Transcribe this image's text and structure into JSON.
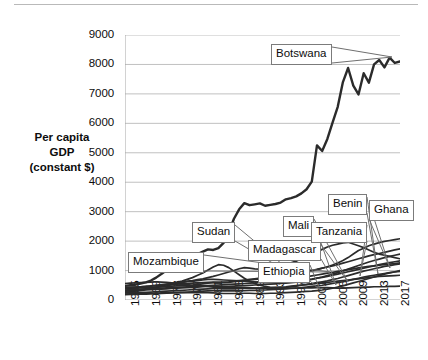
{
  "chart_data": {
    "type": "line",
    "title": "",
    "xlabel": "",
    "ylabel": "Per capita GDP (constant $)",
    "ylabel_lines": [
      "Per capita",
      "GDP",
      "(constant $)"
    ],
    "ylim": [
      0,
      9000
    ],
    "ytick_values": [
      0,
      1000,
      2000,
      3000,
      4000,
      5000,
      6000,
      7000,
      8000,
      9000
    ],
    "ytick_labels": [
      "0",
      "1000",
      "2000",
      "3000",
      "4000",
      "5000",
      "6000",
      "7000",
      "8000",
      "9000"
    ],
    "xlim": [
      1965,
      2018
    ],
    "xtick_labels": [
      "1965",
      "1969",
      "1973",
      "1977",
      "1981",
      "1985",
      "1989",
      "1993",
      "1997",
      "2001",
      "2005",
      "2009",
      "2013",
      "2017"
    ],
    "xtick_values": [
      1965,
      1969,
      1973,
      1977,
      1981,
      1985,
      1989,
      1993,
      1997,
      2001,
      2005,
      2009,
      2013,
      2017
    ],
    "grid": "horizontal",
    "legend": "callout-labels",
    "line_color": "#2b2b2b",
    "grid_color": "#c0c0c0",
    "axis_color": "#a6a6a6",
    "annotations": [
      {
        "label": "Botswana",
        "box_x": 271,
        "box_y": 44,
        "tip_x": 392,
        "tip_y": 57
      },
      {
        "label": "Mozambique",
        "box_x": 128,
        "box_y": 252,
        "tip_x": 330,
        "tip_y": 272
      },
      {
        "label": "Sudan",
        "box_x": 192,
        "box_y": 222,
        "tip_x": 300,
        "tip_y": 279
      },
      {
        "label": "Madagascar",
        "box_x": 248,
        "box_y": 240,
        "tip_x": 336,
        "tip_y": 285
      },
      {
        "label": "Ethiopia",
        "box_x": 258,
        "box_y": 262,
        "tip_x": 320,
        "tip_y": 290
      },
      {
        "label": "Mali",
        "box_x": 283,
        "box_y": 216,
        "tip_x": 348,
        "tip_y": 282
      },
      {
        "label": "Tanzania",
        "box_x": 311,
        "box_y": 222,
        "tip_x": 360,
        "tip_y": 276
      },
      {
        "label": "Benin",
        "box_x": 328,
        "box_y": 194,
        "tip_x": 378,
        "tip_y": 274
      },
      {
        "label": "Ghana",
        "box_x": 369,
        "box_y": 200,
        "tip_x": 390,
        "tip_y": 268
      }
    ],
    "series": [
      {
        "name": "Botswana",
        "emphasis": "thick",
        "values": [
          480,
          500,
          520,
          560,
          600,
          660,
          760,
          880,
          1010,
          1120,
          1180,
          1260,
          1390,
          1450,
          1560,
          1640,
          1720,
          1700,
          1760,
          1940,
          2300,
          2760,
          3080,
          3290,
          3220,
          3250,
          3280,
          3200,
          3230,
          3260,
          3310,
          3420,
          3460,
          3520,
          3620,
          3760,
          4020,
          5250,
          5060,
          5470,
          6020,
          6560,
          7400,
          7880,
          7280,
          6980,
          7700,
          7380,
          8000,
          8150,
          7900,
          8230,
          8050,
          8100
        ]
      },
      {
        "name": "Sudan",
        "values": [
          320,
          330,
          340,
          360,
          380,
          400,
          420,
          450,
          480,
          520,
          560,
          600,
          640,
          660,
          690,
          720,
          760,
          800,
          850,
          900,
          950,
          1000,
          1060,
          1100,
          1080,
          1060,
          1050,
          1060,
          1080,
          1120,
          1160,
          1200,
          1260,
          1320,
          1400,
          1480,
          1560,
          1640,
          1720,
          1800,
          1860,
          1900,
          1940,
          1960,
          1900,
          1840,
          1780,
          1700,
          1620,
          1560,
          1520,
          1480,
          1440,
          1400
        ]
      },
      {
        "name": "Mozambique",
        "values": [
          260,
          280,
          300,
          330,
          360,
          400,
          440,
          480,
          520,
          560,
          600,
          640,
          700,
          760,
          840,
          920,
          1020,
          1120,
          1200,
          1180,
          1100,
          980,
          860,
          740,
          640,
          560,
          500,
          460,
          430,
          420,
          420,
          430,
          450,
          470,
          500,
          520,
          540,
          560,
          580,
          600,
          620,
          640,
          660,
          680,
          700,
          720,
          740,
          760,
          780,
          800,
          810,
          820,
          830,
          840
        ]
      },
      {
        "name": "Ghana",
        "values": [
          420,
          430,
          440,
          450,
          460,
          470,
          490,
          510,
          520,
          530,
          540,
          550,
          560,
          570,
          580,
          590,
          600,
          610,
          600,
          590,
          600,
          620,
          640,
          660,
          680,
          700,
          720,
          740,
          760,
          780,
          800,
          820,
          850,
          880,
          910,
          950,
          990,
          1030,
          1080,
          1130,
          1190,
          1260,
          1340,
          1440,
          1560,
          1680,
          1760,
          1840,
          1900,
          1950,
          1990,
          2020,
          2050,
          2080
        ]
      },
      {
        "name": "Benin",
        "values": [
          380,
          390,
          400,
          410,
          420,
          430,
          440,
          450,
          460,
          470,
          480,
          490,
          500,
          510,
          530,
          550,
          570,
          590,
          600,
          610,
          620,
          640,
          660,
          680,
          700,
          720,
          740,
          760,
          780,
          800,
          820,
          840,
          870,
          900,
          930,
          960,
          1000,
          1040,
          1080,
          1120,
          1160,
          1200,
          1250,
          1300,
          1350,
          1400,
          1450,
          1500,
          1540,
          1580,
          1620,
          1660,
          1700,
          1740
        ]
      },
      {
        "name": "Tanzania",
        "values": [
          300,
          310,
          320,
          330,
          340,
          350,
          360,
          370,
          380,
          390,
          400,
          410,
          420,
          430,
          440,
          450,
          460,
          470,
          470,
          460,
          460,
          470,
          480,
          490,
          500,
          510,
          520,
          530,
          540,
          550,
          560,
          570,
          590,
          610,
          640,
          670,
          700,
          740,
          780,
          830,
          880,
          930,
          990,
          1050,
          1110,
          1170,
          1230,
          1290,
          1340,
          1390,
          1440,
          1480,
          1520,
          1560
        ]
      },
      {
        "name": "Mali",
        "values": [
          340,
          350,
          350,
          360,
          370,
          380,
          390,
          400,
          410,
          420,
          430,
          440,
          450,
          460,
          470,
          480,
          490,
          500,
          510,
          520,
          530,
          540,
          550,
          560,
          570,
          580,
          600,
          620,
          640,
          660,
          680,
          700,
          720,
          740,
          760,
          790,
          820,
          850,
          880,
          910,
          940,
          970,
          1000,
          1030,
          1060,
          1090,
          1120,
          1140,
          1160,
          1180,
          1200,
          1220,
          1240,
          1260
        ]
      },
      {
        "name": "Madagascar",
        "values": [
          560,
          570,
          580,
          590,
          600,
          610,
          620,
          610,
          600,
          580,
          560,
          540,
          520,
          500,
          490,
          480,
          460,
          440,
          430,
          420,
          420,
          420,
          420,
          420,
          410,
          400,
          400,
          400,
          400,
          400,
          400,
          400,
          400,
          400,
          400,
          410,
          410,
          420,
          420,
          420,
          410,
          400,
          400,
          410,
          420,
          430,
          440,
          440,
          450,
          450,
          450,
          460,
          460,
          470
        ]
      },
      {
        "name": "Ethiopia",
        "values": [
          200,
          210,
          210,
          220,
          220,
          230,
          230,
          240,
          240,
          250,
          250,
          250,
          250,
          250,
          250,
          250,
          250,
          240,
          230,
          220,
          220,
          220,
          220,
          230,
          230,
          220,
          220,
          220,
          230,
          230,
          240,
          250,
          260,
          270,
          280,
          290,
          300,
          320,
          340,
          370,
          400,
          440,
          480,
          530,
          580,
          630,
          680,
          730,
          780,
          830,
          880,
          920,
          960,
          1000
        ]
      },
      {
        "name": "OtherA",
        "values": [
          240,
          250,
          250,
          260,
          260,
          270,
          280,
          290,
          300,
          310,
          320,
          330,
          340,
          350,
          360,
          370,
          380,
          390,
          390,
          380,
          380,
          380,
          390,
          400,
          400,
          400,
          400,
          410,
          420,
          430,
          440,
          450,
          470,
          490,
          510,
          530,
          560,
          590,
          620,
          650,
          690,
          730,
          780,
          830,
          880,
          930,
          980,
          1020,
          1060,
          1100,
          1140,
          1170,
          1200,
          1230
        ]
      },
      {
        "name": "OtherB",
        "values": [
          420,
          430,
          440,
          450,
          460,
          480,
          500,
          520,
          540,
          560,
          580,
          600,
          620,
          640,
          660,
          680,
          700,
          700,
          690,
          680,
          670,
          660,
          650,
          640,
          630,
          620,
          610,
          600,
          600,
          600,
          610,
          620,
          630,
          650,
          670,
          690,
          710,
          740,
          770,
          800,
          840,
          880,
          920,
          960,
          1000,
          1040,
          1080,
          1120,
          1160,
          1200,
          1240,
          1270,
          1300,
          1330
        ]
      },
      {
        "name": "OtherC",
        "values": [
          180,
          190,
          190,
          200,
          200,
          210,
          210,
          220,
          230,
          240,
          250,
          260,
          270,
          280,
          290,
          300,
          310,
          320,
          320,
          310,
          310,
          310,
          320,
          320,
          330,
          330,
          340,
          340,
          350,
          360,
          370,
          380,
          390,
          400,
          420,
          440,
          460,
          480,
          500,
          530,
          560,
          590,
          620,
          660,
          700,
          740,
          780,
          810,
          840,
          870,
          900,
          930,
          950,
          970
        ]
      }
    ]
  }
}
